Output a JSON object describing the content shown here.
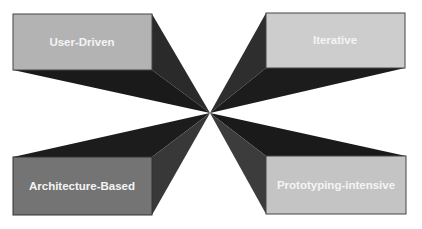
{
  "diagram": {
    "type": "four-quadrant converging boxes",
    "boxes": [
      {
        "id": "user-driven",
        "label": "User-Driven",
        "position": "top-left",
        "fill": "#b3b3b3"
      },
      {
        "id": "iterative",
        "label": "Iterative",
        "position": "top-right",
        "fill": "#cdcdcd"
      },
      {
        "id": "architecture-based",
        "label": "Architecture-Based",
        "position": "bottom-left",
        "fill": "#747474"
      },
      {
        "id": "prototyping-intensive",
        "label": "Prototyping-intensive",
        "position": "bottom-right",
        "fill": "#c4c4c4"
      }
    ],
    "shadow_colors": {
      "dark": "#1e1e1e",
      "mid": "#3a3a3a"
    }
  }
}
